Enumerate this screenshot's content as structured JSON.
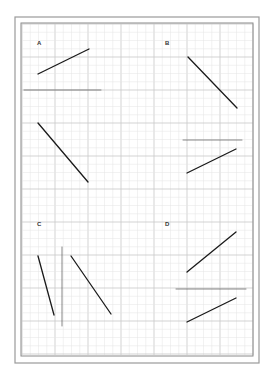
{
  "figure": {
    "width": 271,
    "height": 373,
    "background": "#ffffff",
    "outer_frame": {
      "x": 15,
      "y": 17,
      "w": 244,
      "h": 346,
      "color": "#9a9a9a"
    },
    "inner_frame": {
      "x": 21,
      "y": 23,
      "w": 232,
      "h": 333,
      "color": "#8a8a8a"
    },
    "grid": {
      "x0": 22,
      "y0": 24,
      "x1": 253,
      "y1": 355,
      "minor_spacing": 8.25,
      "major_every": 4,
      "minor_color": "#e4e4e4",
      "major_color": "#c8c8c8"
    },
    "line_color": "#1a1a1a",
    "guide_color": "#555555"
  },
  "panels": [
    {
      "id": "A",
      "label": "A",
      "label_pos": [
        37,
        45
      ],
      "segments": [
        {
          "kind": "stroke",
          "x1": 38,
          "y1": 74,
          "x2": 89,
          "y2": 49
        },
        {
          "kind": "guide",
          "x1": 24,
          "y1": 90,
          "x2": 101,
          "y2": 90
        },
        {
          "kind": "stroke",
          "x1": 38,
          "y1": 123,
          "x2": 88,
          "y2": 182
        }
      ]
    },
    {
      "id": "B",
      "label": "B",
      "label_pos": [
        165,
        45
      ],
      "segments": [
        {
          "kind": "stroke",
          "x1": 188,
          "y1": 57,
          "x2": 237,
          "y2": 108
        },
        {
          "kind": "guide",
          "x1": 183,
          "y1": 140,
          "x2": 242,
          "y2": 140
        },
        {
          "kind": "stroke",
          "x1": 187,
          "y1": 173,
          "x2": 236,
          "y2": 149
        }
      ]
    },
    {
      "id": "C",
      "label": "C",
      "label_pos": [
        37,
        226
      ],
      "segments": [
        {
          "kind": "stroke",
          "x1": 38,
          "y1": 256,
          "x2": 54,
          "y2": 315
        },
        {
          "kind": "guide",
          "x1": 62,
          "y1": 247,
          "x2": 62,
          "y2": 326
        },
        {
          "kind": "stroke",
          "x1": 71,
          "y1": 256,
          "x2": 111,
          "y2": 314
        }
      ]
    },
    {
      "id": "D",
      "label": "D",
      "label_pos": [
        165,
        226
      ],
      "segments": [
        {
          "kind": "stroke",
          "x1": 187,
          "y1": 272,
          "x2": 236,
          "y2": 232
        },
        {
          "kind": "guide",
          "x1": 176,
          "y1": 289,
          "x2": 246,
          "y2": 289
        },
        {
          "kind": "stroke",
          "x1": 187,
          "y1": 322,
          "x2": 236,
          "y2": 298
        }
      ]
    }
  ]
}
